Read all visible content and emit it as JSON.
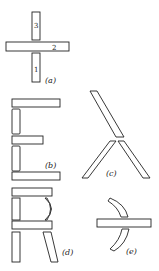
{
  "figures": {
    "a": {
      "label": "(a)",
      "parts": [
        {
          "number": "3"
        },
        {
          "number": "2"
        },
        {
          "number": "1"
        }
      ]
    },
    "b": {
      "label": "(b)"
    },
    "c": {
      "label": "(c)"
    },
    "d": {
      "label": "(d)"
    },
    "e": {
      "label": "(e)"
    }
  },
  "colors": {
    "stroke": "#222222",
    "background": "#ffffff"
  }
}
